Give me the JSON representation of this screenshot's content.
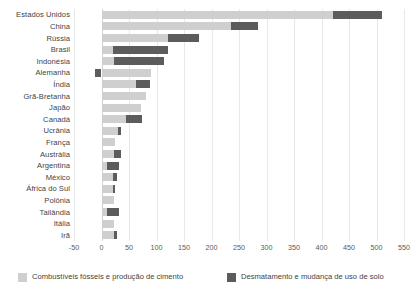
{
  "chart_data": {
    "type": "bar",
    "orientation": "horizontal",
    "stacked": true,
    "title": "",
    "subtitle": "",
    "xlabel": "",
    "ylabel": "",
    "xlim": [
      -50,
      550
    ],
    "xticks": [
      -50,
      0,
      50,
      100,
      150,
      200,
      250,
      300,
      350,
      400,
      450,
      500,
      550
    ],
    "xtick_labels": [
      "-50",
      "0",
      "50",
      "100",
      "150",
      "200",
      "250",
      "300",
      "350",
      "400",
      "450",
      "500",
      "550"
    ],
    "grid": true,
    "grid_axis": "x",
    "legend_position": "bottom",
    "categories": [
      "Estados Unidos",
      "China",
      "Rússia",
      "Brasil",
      "Indonésia",
      "Alemanha",
      "Índia",
      "Grã-Bretanha",
      "Japão",
      "Canadá",
      "Ucrânia",
      "França",
      "Austrália",
      "Argentina",
      "México",
      "África do Sul",
      "Polônia",
      "Tailândia",
      "Itália",
      "Irã"
    ],
    "series": [
      {
        "name": "Combustíveis fósseis e produção de cimento",
        "color": "#cfcfcf",
        "values": [
          420,
          235,
          120,
          20,
          22,
          90,
          63,
          80,
          72,
          45,
          30,
          25,
          22,
          10,
          20,
          20,
          22,
          10,
          22,
          22
        ]
      },
      {
        "name": "Desmatamento e mudança de uso de solo",
        "color": "#5c5c5c",
        "values": [
          90,
          50,
          58,
          100,
          92,
          -12,
          26,
          0,
          0,
          28,
          5,
          0,
          14,
          22,
          8,
          4,
          0,
          22,
          0,
          6
        ]
      }
    ],
    "totals": [
      510,
      285,
      178,
      120,
      114,
      78,
      89,
      80,
      72,
      73,
      35,
      25,
      36,
      32,
      28,
      24,
      22,
      32,
      22,
      28
    ],
    "units": "Gt CO2 (acumulado)"
  },
  "legend": {
    "items": [
      {
        "label": "Combustíveis fósseis e produção de cimento",
        "color": "#cfcfcf",
        "swatch": "fossil"
      },
      {
        "label": "Desmatamento e mudança de uso de solo",
        "color": "#5c5c5c",
        "swatch": "land"
      }
    ]
  },
  "colors": {
    "fossil": "#cfcfcf",
    "land": "#5c5c5c",
    "grid": "#e8e8e8",
    "zero_line": "#d2d2d2",
    "text": "#3f3f3f",
    "background": "#ffffff"
  }
}
